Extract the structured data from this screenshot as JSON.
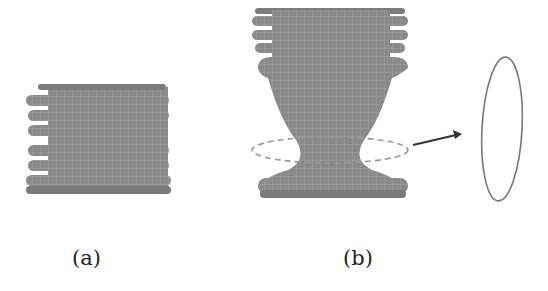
{
  "figure": {
    "panels": [
      {
        "id": "a",
        "label": "(a)",
        "description": "Bellows-shaped mesh with stacked ridges (undeformed)"
      },
      {
        "id": "b",
        "label": "(b)",
        "description": "Deformed mesh with necked waist; dashed ellipse marks cross-section"
      },
      {
        "id": "inset",
        "label": "",
        "description": "Extracted thin elliptical cross-section ring"
      }
    ],
    "colors": {
      "mesh": "#8a8a8a",
      "mesh_dark": "#6e6e6e",
      "grid": "#a9a9a9",
      "dashed": "#999999",
      "arrow": "#333333"
    }
  }
}
